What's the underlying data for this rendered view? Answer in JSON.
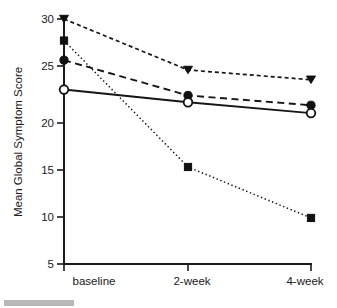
{
  "chart_data": {
    "type": "line",
    "title": "",
    "xlabel": "",
    "ylabel": "Mean Global Symptom Score",
    "categories": [
      "baseline",
      "2-week",
      "4-week"
    ],
    "ylim": [
      5,
      30
    ],
    "yticks": [
      5,
      10,
      15,
      20,
      25,
      30
    ],
    "ytick_labels": [
      "5",
      "10",
      "15",
      "20",
      "25",
      "30"
    ],
    "grid": false,
    "legend": "none",
    "series": [
      {
        "name": "series-triangle-short-dash",
        "marker": "triangle-down-filled",
        "linestyle": "short-dash",
        "values": [
          30.0,
          24.8,
          23.8
        ]
      },
      {
        "name": "series-filled-circle-long-dash",
        "marker": "circle-filled",
        "linestyle": "long-dash",
        "values": [
          25.8,
          22.2,
          21.2
        ]
      },
      {
        "name": "series-open-circle-solid",
        "marker": "circle-open",
        "linestyle": "solid",
        "values": [
          22.8,
          21.5,
          20.4
        ]
      },
      {
        "name": "series-square-dotted",
        "marker": "square-filled",
        "linestyle": "dotted",
        "values": [
          27.8,
          14.9,
          9.7
        ]
      }
    ]
  },
  "axis": {
    "y_title": "Mean Global Symptom Score",
    "y_tick_0": "5",
    "y_tick_1": "10",
    "y_tick_2": "15",
    "y_tick_3": "20",
    "y_tick_4": "25",
    "y_tick_5": "30",
    "x_tick_0": "baseline",
    "x_tick_1": "2-week",
    "x_tick_2": "4-week"
  },
  "colors": {
    "ink": "#1a1a1a",
    "background": "#ffffff",
    "footer_bar": "#b8b8b8"
  }
}
